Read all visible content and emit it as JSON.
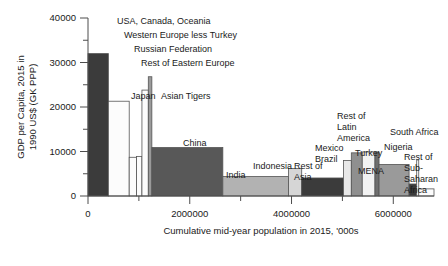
{
  "chart_data": {
    "type": "bar",
    "title": "",
    "subtitle": "",
    "xlabel": "Cumulative mid-year population in 2015, '000s",
    "ylabel": "GDP per Capita, 2015 in 1990 US$ (GK PPP)",
    "xlim": [
      0,
      6800000
    ],
    "ylim": [
      0,
      40000
    ],
    "grid": false,
    "legend_position": "none",
    "note": "Variable-width (Marimekko / population-weighted) bar chart: bar width = population, bar height = GDP per capita",
    "x_ticks": [
      0,
      1000000,
      2000000,
      3000000,
      4000000,
      5000000,
      6000000
    ],
    "x_tick_labels": [
      "0",
      "",
      "2000000",
      "",
      "4000000",
      "",
      "6000000"
    ],
    "y_ticks": [
      0,
      5000,
      10000,
      15000,
      20000,
      25000,
      30000,
      35000,
      40000
    ],
    "y_tick_labels": [
      "0",
      "",
      "10000",
      "",
      "20000",
      "",
      "30000",
      "",
      "40000"
    ],
    "categories": [
      "USA, Canada, Oceania",
      "Western Europe less Turkey",
      "Russian Federation",
      "Rest of Eastern Europe",
      "Japan",
      "Asian Tigers",
      "China",
      "India",
      "Indonesia",
      "Rest of Asia",
      "Mexico",
      "Brazil",
      "Rest of Latin America",
      "Turkey",
      "MENA",
      "Nigeria",
      "South Africa",
      "Rest of Sub-Saharan Africa"
    ],
    "bars": [
      {
        "label": "USA, Canada, Oceania",
        "gdp_per_capita": 32000,
        "pop_start": 0,
        "pop_end": 400000,
        "fill": "#3b3b3b"
      },
      {
        "label": "Western Europe less Turkey",
        "gdp_per_capita": 21300,
        "pop_start": 400000,
        "pop_end": 810000,
        "fill": "#fcfcfc"
      },
      {
        "label": "Russian Federation",
        "gdp_per_capita": 8700,
        "pop_start": 810000,
        "pop_end": 955000,
        "fill": "#fcfcfc"
      },
      {
        "label": "Rest of Eastern Europe",
        "gdp_per_capita": 8900,
        "pop_start": 955000,
        "pop_end": 1060000,
        "fill": "#fcfcfc"
      },
      {
        "label": "Japan",
        "gdp_per_capita": 23800,
        "pop_start": 1060000,
        "pop_end": 1185000,
        "fill": "#fcfcfc"
      },
      {
        "label": "Asian Tigers",
        "gdp_per_capita": 26800,
        "pop_start": 1185000,
        "pop_end": 1255000,
        "fill": "#9a9a9a"
      },
      {
        "label": "China",
        "gdp_per_capita": 10900,
        "pop_start": 1255000,
        "pop_end": 2650000,
        "fill": "#585858"
      },
      {
        "label": "India",
        "gdp_per_capita": 4400,
        "pop_start": 2650000,
        "pop_end": 3940000,
        "fill": "#b2b2b2"
      },
      {
        "label": "Indonesia",
        "gdp_per_capita": 6200,
        "pop_start": 3940000,
        "pop_end": 4200000,
        "fill": "#d6d6d6"
      },
      {
        "label": "Rest of Asia",
        "gdp_per_capita": 4050,
        "pop_start": 4200000,
        "pop_end": 5020000,
        "fill": "#3b3b3b"
      },
      {
        "label": "Mexico",
        "gdp_per_capita": 8000,
        "pop_start": 5020000,
        "pop_end": 5175000,
        "fill": "#e8e8e8"
      },
      {
        "label": "Brazil",
        "gdp_per_capita": 9700,
        "pop_start": 5175000,
        "pop_end": 5390000,
        "fill": "#8f8f8f"
      },
      {
        "label": "Rest of Latin America",
        "gdp_per_capita": 9900,
        "pop_start": 5390000,
        "pop_end": 5640000,
        "fill": "#f2f2f2"
      },
      {
        "label": "Turkey",
        "gdp_per_capita": 9900,
        "pop_start": 5640000,
        "pop_end": 5720000,
        "fill": "#6e6e6e"
      },
      {
        "label": "MENA",
        "gdp_per_capita": 7100,
        "pop_start": 5720000,
        "pop_end": 6310000,
        "fill": "#9a9a9a"
      },
      {
        "label": "Nigeria",
        "gdp_per_capita": 2700,
        "pop_start": 6310000,
        "pop_end": 6460000,
        "fill": "#3b3b3b"
      },
      {
        "label": "South Africa",
        "gdp_per_capita": 8100,
        "pop_start": 6460000,
        "pop_end": 6500000,
        "fill": "#fcfcfc"
      },
      {
        "label": "Rest of Sub-Saharan Africa",
        "gdp_per_capita": 1600,
        "pop_start": 6500000,
        "pop_end": 6800000,
        "fill": "#fcfcfc"
      }
    ],
    "annotations": [
      {
        "text": "USA, Canada, Oceania",
        "x": 117,
        "y": 24,
        "anchor": "start",
        "lines": [
          "USA, Canada, Oceania"
        ]
      },
      {
        "text": "Western Europe less Turkey",
        "x": 124,
        "y": 38,
        "anchor": "start",
        "lines": [
          "Western Europe less Turkey"
        ]
      },
      {
        "text": "Russian Federation",
        "x": 134,
        "y": 52,
        "anchor": "start",
        "lines": [
          "Russian Federation"
        ]
      },
      {
        "text": "Rest of Eastern Europe",
        "x": 141,
        "y": 66,
        "anchor": "start",
        "lines": [
          "Rest of Eastern Europe"
        ]
      },
      {
        "text": "Japan",
        "x": 131,
        "y": 99,
        "anchor": "start",
        "lines": [
          "Japan"
        ]
      },
      {
        "text": "Asian Tigers",
        "x": 161,
        "y": 99,
        "anchor": "start",
        "lines": [
          "Asian Tigers"
        ]
      },
      {
        "text": "China",
        "x": 183,
        "y": 146,
        "anchor": "start",
        "lines": [
          "China"
        ]
      },
      {
        "text": "India",
        "x": 226,
        "y": 178,
        "anchor": "start",
        "lines": [
          "India"
        ]
      },
      {
        "text": "Indonesia",
        "x": 253,
        "y": 169,
        "anchor": "start",
        "lines": [
          "Indonesia"
        ]
      },
      {
        "text": "Rest of Asia",
        "x": 294,
        "y": 169,
        "anchor": "start",
        "lines": [
          "Rest of",
          "Asia"
        ]
      },
      {
        "text": "Mexico Brazil",
        "x": 315,
        "y": 151,
        "anchor": "start",
        "lines": [
          "Mexico",
          "Brazil"
        ]
      },
      {
        "text": "Rest of Latin America",
        "x": 337,
        "y": 119,
        "anchor": "start",
        "lines": [
          "Rest of",
          "Latin",
          "America"
        ]
      },
      {
        "text": "Turkey",
        "x": 355,
        "y": 156,
        "anchor": "start",
        "lines": [
          "Turkey"
        ]
      },
      {
        "text": "MENA",
        "x": 358,
        "y": 174,
        "anchor": "start",
        "lines": [
          "MENA"
        ]
      },
      {
        "text": "Nigeria",
        "x": 384,
        "y": 150,
        "anchor": "start",
        "lines": [
          "Nigeria"
        ]
      },
      {
        "text": "South Africa",
        "x": 390,
        "y": 135,
        "anchor": "start",
        "lines": [
          "South Africa"
        ]
      },
      {
        "text": "Rest of Sub-Saharan Africa",
        "x": 404,
        "y": 160,
        "anchor": "start",
        "lines": [
          "Rest of",
          "Sub-",
          "Saharan",
          "Africa"
        ]
      }
    ]
  }
}
